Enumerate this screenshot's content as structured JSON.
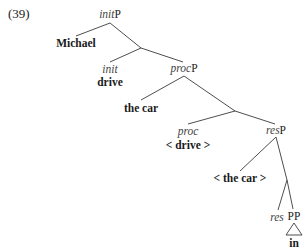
{
  "example_number": "(39)",
  "nodes": {
    "root": {
      "head": "init",
      "suffix": "P"
    },
    "spec_init": {
      "text": "Michael"
    },
    "init_head": {
      "label": "init",
      "word": "drive"
    },
    "procP": {
      "head": "proc",
      "suffix": "P"
    },
    "spec_proc": {
      "text": "the car"
    },
    "proc_head": {
      "label": "proc",
      "word": "< drive >"
    },
    "resP": {
      "head": "res",
      "suffix": "P"
    },
    "spec_res": {
      "text": "< the car >"
    },
    "res_head": {
      "label": "res"
    },
    "pp": {
      "label": "PP",
      "word": "in"
    }
  },
  "tree_structure": "[initP Michael [ [init drive] [procP the car [ [proc <drive>] [resP <the car> [ res [PP in] ] ] ] ] ] ]",
  "colors": {
    "lines": "#3a3a3a",
    "text": "#1a1a1a",
    "italic": "#444444"
  }
}
